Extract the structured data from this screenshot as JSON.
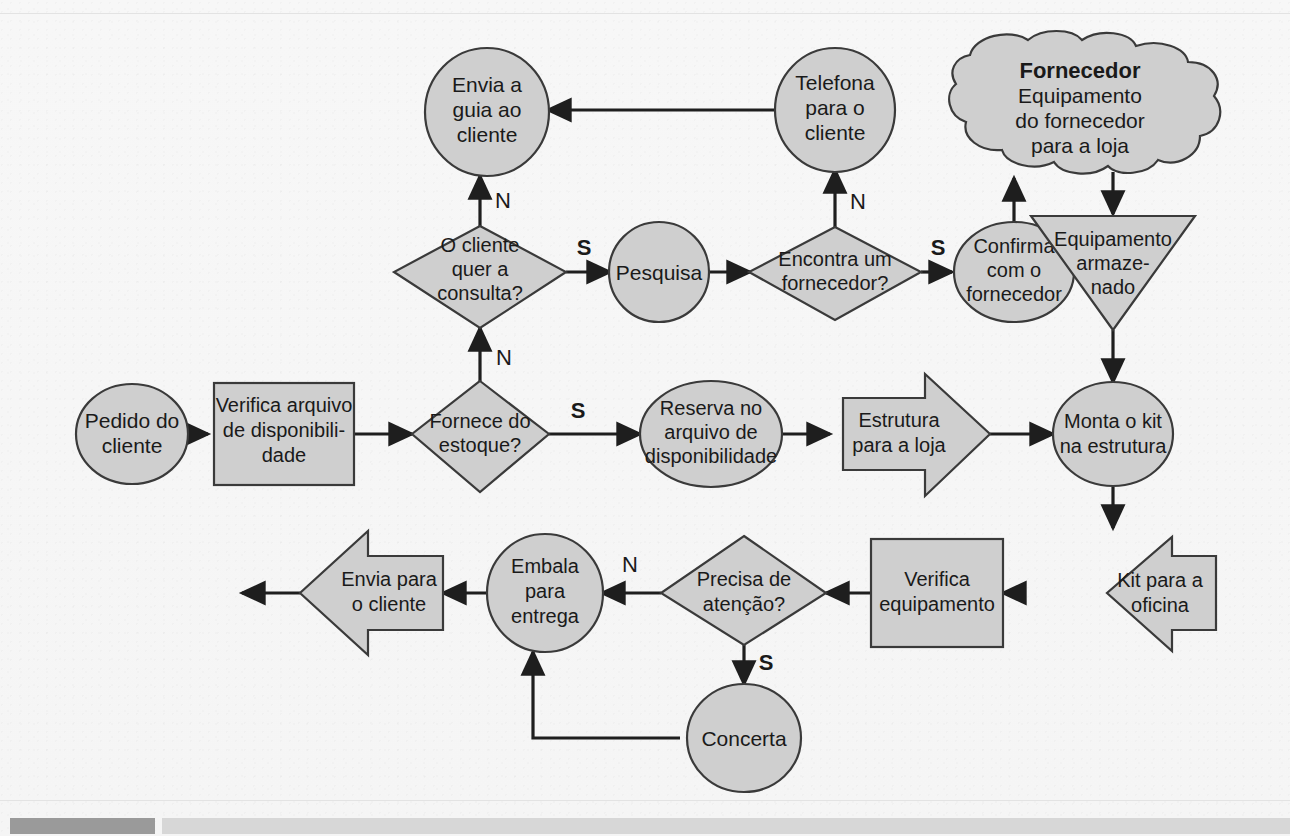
{
  "diagram": {
    "colors": {
      "shape_fill": "#cfcfcf",
      "shape_stroke": "#3a3a3a",
      "connector": "#1e1e1e",
      "page_background": "#f6f6f6",
      "footer_dark_bar": "#9a9a9a",
      "footer_light_bar": "#d7d7d7"
    },
    "nodes": [
      {
        "id": "pedido",
        "shape": "circle",
        "lines": [
          "Pedido do",
          "cliente"
        ]
      },
      {
        "id": "verifica_arq",
        "shape": "rectangle",
        "lines": [
          "Verifica arquivo",
          "de disponibili-",
          "dade"
        ]
      },
      {
        "id": "fornece_est",
        "shape": "decision",
        "lines": [
          "Fornece do",
          "estoque?"
        ]
      },
      {
        "id": "reserva",
        "shape": "circle",
        "lines": [
          "Reserva no",
          "arquivo de",
          "disponibilidade"
        ]
      },
      {
        "id": "estrutura",
        "shape": "arrow-right",
        "lines": [
          "Estrutura",
          "para a loja"
        ]
      },
      {
        "id": "monta_kit",
        "shape": "circle",
        "lines": [
          "Monta o kit",
          "na estrutura"
        ],
        "italic_words": [
          "kit"
        ]
      },
      {
        "id": "cliente_quer",
        "shape": "decision",
        "lines": [
          "O cliente",
          "quer a",
          "consulta?"
        ]
      },
      {
        "id": "pesquisa",
        "shape": "circle",
        "lines": [
          "Pesquisa"
        ]
      },
      {
        "id": "encontra_forn",
        "shape": "decision",
        "lines": [
          "Encontra um",
          "fornecedor?"
        ]
      },
      {
        "id": "confirma_forn",
        "shape": "circle",
        "lines": [
          "Confirma",
          "com o",
          "fornecedor"
        ]
      },
      {
        "id": "fornecedor",
        "shape": "cloud",
        "lines": [
          "Fornecedor",
          "Equipamento",
          "do fornecedor",
          "para a loja"
        ],
        "bold_lines": [
          "Fornecedor"
        ]
      },
      {
        "id": "equip_arm",
        "shape": "triangle-down",
        "lines": [
          "Equipamento",
          "armaze-",
          "nado"
        ]
      },
      {
        "id": "envia_guia",
        "shape": "circle",
        "lines": [
          "Envia a",
          "guia ao",
          "cliente"
        ]
      },
      {
        "id": "telefona",
        "shape": "circle",
        "lines": [
          "Telefona",
          "para o",
          "cliente"
        ]
      },
      {
        "id": "kit_oficina",
        "shape": "arrow-left",
        "lines": [
          "Kit para a",
          "oficina"
        ],
        "italic_words": [
          "Kit"
        ]
      },
      {
        "id": "verifica_equip",
        "shape": "rectangle",
        "lines": [
          "Verifica",
          "equipamento"
        ]
      },
      {
        "id": "precisa_aten",
        "shape": "decision",
        "lines": [
          "Precisa de",
          "atenção?"
        ]
      },
      {
        "id": "concerta",
        "shape": "circle",
        "lines": [
          "Concerta"
        ]
      },
      {
        "id": "embala",
        "shape": "circle",
        "lines": [
          "Embala",
          "para",
          "entrega"
        ]
      },
      {
        "id": "envia_cliente",
        "shape": "arrow-left",
        "lines": [
          "Envia para",
          "o cliente"
        ]
      }
    ],
    "edge_labels": {
      "quer_consulta_no": "N",
      "quer_consulta_yes": "S",
      "fornece_estoque_no": "N",
      "fornece_estoque_yes": "S",
      "encontra_no": "N",
      "encontra_yes": "S",
      "precisa_no": "N",
      "precisa_yes": "S"
    }
  }
}
